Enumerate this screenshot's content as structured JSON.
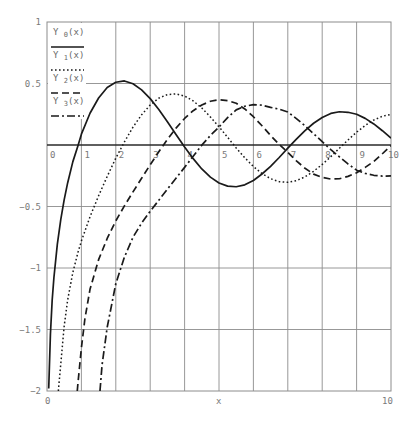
{
  "chart_data": {
    "type": "line",
    "title": "",
    "xlabel": "x",
    "ylabel": "",
    "xlim": [
      0,
      10
    ],
    "ylim": [
      -2,
      1
    ],
    "grid": true,
    "legend_position": "top-left (inside)",
    "x_ticks_inner": [
      "0",
      "1",
      "2",
      "3",
      "4",
      "5",
      "6",
      "7",
      "8",
      "9",
      "10"
    ],
    "x_axis_bottom_labels": {
      "left": "0",
      "center": "x",
      "right": "10"
    },
    "y_ticks": [
      "1",
      "0.5",
      "-0.5",
      "-1",
      "-1.5",
      "-2"
    ],
    "series": [
      {
        "name": "Y0(x)",
        "base": "Y",
        "sub": "0",
        "arg": "(x)",
        "style": "solid",
        "points": [
          [
            0.05,
            -1.979
          ],
          [
            0.1,
            -1.5342
          ],
          [
            0.15,
            -1.2647
          ],
          [
            0.2,
            -1.0811
          ],
          [
            0.3,
            -0.8073
          ],
          [
            0.4,
            -0.606
          ],
          [
            0.5,
            -0.4445
          ],
          [
            0.6,
            -0.3085
          ],
          [
            0.75,
            -0.1372
          ],
          [
            0.9,
            -0.0056
          ],
          [
            1,
            0.0883
          ],
          [
            1.25,
            0.2582
          ],
          [
            1.5,
            0.3824
          ],
          [
            1.75,
            0.4679
          ],
          [
            2,
            0.5104
          ],
          [
            2.25,
            0.5208
          ],
          [
            2.5,
            0.4981
          ],
          [
            2.75,
            0.4485
          ],
          [
            3,
            0.3769
          ],
          [
            3.25,
            0.2883
          ],
          [
            3.5,
            0.189
          ],
          [
            3.75,
            0.0849
          ],
          [
            4,
            -0.0169
          ],
          [
            4.25,
            -0.111
          ],
          [
            4.5,
            -0.1947
          ],
          [
            4.75,
            -0.2612
          ],
          [
            5,
            -0.3085
          ],
          [
            5.25,
            -0.3343
          ],
          [
            5.5,
            -0.3395
          ],
          [
            5.75,
            -0.324
          ],
          [
            6,
            -0.2882
          ],
          [
            6.25,
            -0.2358
          ],
          [
            6.5,
            -0.1732
          ],
          [
            6.75,
            -0.1016
          ],
          [
            7,
            -0.0259
          ],
          [
            7.25,
            0.0474
          ],
          [
            7.5,
            0.1173
          ],
          [
            7.75,
            0.1768
          ],
          [
            8,
            0.2235
          ],
          [
            8.25,
            0.2569
          ],
          [
            8.5,
            0.2702
          ],
          [
            8.75,
            0.2659
          ],
          [
            9,
            0.2499
          ],
          [
            9.25,
            0.2165
          ],
          [
            9.5,
            0.1712
          ],
          [
            9.75,
            0.1162
          ],
          [
            10,
            0.0557
          ]
        ]
      },
      {
        "name": "Y1(x)",
        "base": "Y",
        "sub": "1",
        "arg": "(x)",
        "style": "dotted",
        "points": [
          [
            0.33,
            -2.0
          ],
          [
            0.4,
            -1.7809
          ],
          [
            0.5,
            -1.4715
          ],
          [
            0.6,
            -1.2604
          ],
          [
            0.75,
            -1.0375
          ],
          [
            0.9,
            -0.8731
          ],
          [
            1,
            -0.7812
          ],
          [
            1.25,
            -0.5844
          ],
          [
            1.5,
            -0.4123
          ],
          [
            1.75,
            -0.2557
          ],
          [
            2,
            -0.107
          ],
          [
            2.25,
            0.0247
          ],
          [
            2.5,
            0.1459
          ],
          [
            2.75,
            0.2453
          ],
          [
            3,
            0.3247
          ],
          [
            3.25,
            0.3807
          ],
          [
            3.5,
            0.4102
          ],
          [
            3.75,
            0.4154
          ],
          [
            4,
            0.3979
          ],
          [
            4.25,
            0.358
          ],
          [
            4.5,
            0.301
          ],
          [
            4.75,
            0.2284
          ],
          [
            5,
            0.1479
          ],
          [
            5.25,
            0.0627
          ],
          [
            5.5,
            -0.0238
          ],
          [
            5.75,
            -0.1036
          ],
          [
            6,
            -0.175
          ],
          [
            6.25,
            -0.2323
          ],
          [
            6.5,
            -0.2741
          ],
          [
            6.75,
            -0.298
          ],
          [
            7,
            -0.3027
          ],
          [
            7.25,
            -0.2896
          ],
          [
            7.5,
            -0.2591
          ],
          [
            7.75,
            -0.214
          ],
          [
            8,
            -0.1581
          ],
          [
            8.25,
            -0.0948
          ],
          [
            8.5,
            -0.0262
          ],
          [
            8.75,
            0.041
          ],
          [
            9,
            0.1043
          ],
          [
            9.25,
            0.1589
          ],
          [
            9.5,
            0.2032
          ],
          [
            9.75,
            0.2336
          ],
          [
            10,
            0.249
          ]
        ]
      },
      {
        "name": "Y2(x)",
        "base": "Y",
        "sub": "2",
        "arg": "(x)",
        "style": "dashed",
        "points": [
          [
            0.88,
            -2.0
          ],
          [
            0.9,
            -1.935
          ],
          [
            1,
            -1.6507
          ],
          [
            1.1,
            -1.4165
          ],
          [
            1.25,
            -1.1731
          ],
          [
            1.5,
            -0.9322
          ],
          [
            1.75,
            -0.7601
          ],
          [
            2,
            -0.6174
          ],
          [
            2.25,
            -0.4948
          ],
          [
            2.5,
            -0.3813
          ],
          [
            2.75,
            -0.2709
          ],
          [
            3,
            -0.1604
          ],
          [
            3.25,
            -0.0552
          ],
          [
            3.5,
            0.0453
          ],
          [
            3.75,
            0.1369
          ],
          [
            4,
            0.2159
          ],
          [
            4.25,
            0.279
          ],
          [
            4.5,
            0.3252
          ],
          [
            4.75,
            0.3555
          ],
          [
            5,
            0.3677
          ],
          [
            5.25,
            0.3611
          ],
          [
            5.5,
            0.339
          ],
          [
            5.75,
            0.2933
          ],
          [
            6,
            0.2299
          ],
          [
            6.25,
            0.1565
          ],
          [
            6.5,
            0.0775
          ],
          [
            6.75,
            0.0045
          ],
          [
            7,
            -0.0605
          ],
          [
            7.25,
            -0.1284
          ],
          [
            7.5,
            -0.1893
          ],
          [
            7.75,
            -0.2365
          ],
          [
            8,
            -0.263
          ],
          [
            8.25,
            -0.2773
          ],
          [
            8.5,
            -0.2743
          ],
          [
            8.75,
            -0.255
          ],
          [
            9,
            -0.2252
          ],
          [
            9.25,
            -0.1822
          ],
          [
            9.5,
            -0.1335
          ],
          [
            9.75,
            -0.0711
          ],
          [
            10,
            -0.0059
          ]
        ]
      },
      {
        "name": "Y3(x)",
        "base": "Y",
        "sub": "3",
        "arg": "(x)",
        "style": "dashdot",
        "points": [
          [
            1.54,
            -2.0
          ],
          [
            1.6,
            -1.79
          ],
          [
            1.75,
            -1.4817
          ],
          [
            2,
            -1.1278
          ],
          [
            2.25,
            -0.912
          ],
          [
            2.5,
            -0.75
          ],
          [
            2.75,
            -0.635
          ],
          [
            3,
            -0.5385
          ],
          [
            3.25,
            -0.449
          ],
          [
            3.5,
            -0.3586
          ],
          [
            3.75,
            -0.27
          ],
          [
            4,
            -0.1821
          ],
          [
            4.25,
            -0.091
          ],
          [
            4.5,
            -0.0014
          ],
          [
            4.75,
            0.078
          ],
          [
            5,
            0.1463
          ],
          [
            5.25,
            0.223
          ],
          [
            5.5,
            0.2855
          ],
          [
            5.75,
            0.315
          ],
          [
            6,
            0.3283
          ],
          [
            6.25,
            0.324
          ],
          [
            6.5,
            0.3057
          ],
          [
            6.75,
            0.292
          ],
          [
            7,
            0.2683
          ],
          [
            7.25,
            0.215
          ],
          [
            7.5,
            0.156
          ],
          [
            7.75,
            0.092
          ],
          [
            8,
            0.0265
          ],
          [
            8.25,
            -0.037
          ],
          [
            8.5,
            -0.0967
          ],
          [
            8.75,
            -0.154
          ],
          [
            9,
            -0.2047
          ],
          [
            9.25,
            -0.231
          ],
          [
            9.5,
            -0.2462
          ],
          [
            9.75,
            -0.253
          ],
          [
            10,
            -0.2513
          ]
        ]
      }
    ]
  },
  "colors": {
    "background": "#ffffff",
    "grid": "#8c8c8c",
    "axis": "#2a2a2a",
    "curve": "#1a1a1a",
    "tick_text": "#7a7a7a"
  }
}
